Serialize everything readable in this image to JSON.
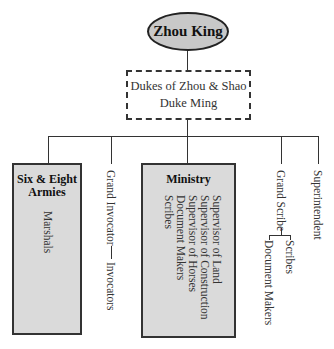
{
  "diagram": {
    "type": "org-chart",
    "root": {
      "label": "Zhou King",
      "shape": "ellipse",
      "fill": "#c8c8c8"
    },
    "level2": {
      "lines": [
        "Dukes of Zhou & Shao",
        "Duke Ming"
      ],
      "border": "dashed"
    },
    "branches": [
      {
        "title_lines": [
          "Six & Eight",
          "Armies"
        ],
        "boxed": true,
        "fill": "#dadada",
        "children": [
          "Marshals"
        ]
      },
      {
        "label": "Grand Invocator",
        "children": [
          "Invocators"
        ]
      },
      {
        "title": "Ministry",
        "boxed": true,
        "fill": "#dadada",
        "children": [
          "Supervisor of Land",
          "Supervisor of Construction",
          "Supervisor of Horses",
          "Document Makers",
          "Scribes"
        ]
      },
      {
        "label": "Grand Scribe",
        "children": [
          "Scribes",
          "Document Makers"
        ]
      },
      {
        "label": "Superintendent",
        "children": []
      }
    ]
  }
}
